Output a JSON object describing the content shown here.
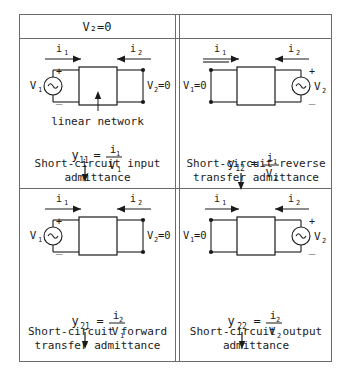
{
  "header": {
    "condition_label": "V₂=0"
  },
  "labels": {
    "i1": "i",
    "i1_sub": "1",
    "i2": "i",
    "i2_sub": "2",
    "v1": "V",
    "v1_sub": "1",
    "v2": "V",
    "v2_sub": "2",
    "v1_shorted": "V₁=0",
    "v2_shorted": "V₂=0",
    "plus": "+",
    "minus": "−",
    "network_note": "linear network",
    "source_symbol": "~"
  },
  "quadrants": [
    {
      "id": "q1",
      "name": "short-circuit-input-admittance",
      "param": "y",
      "param_sub": "11",
      "equals": "=",
      "numerator": "i",
      "numerator_sub": "1",
      "denominator": "V",
      "denominator_sub": "1",
      "left_source": true,
      "right_source": false,
      "left_label": "V",
      "left_label_sub": "1",
      "right_label": "V₂=0",
      "network_note": "linear network",
      "caption": "Short-circuit input\nadmittance"
    },
    {
      "id": "q2",
      "name": "short-circuit-reverse-transfer-admittance",
      "param": "y",
      "param_sub": "12",
      "equals": "=",
      "numerator": "i",
      "numerator_sub": "1",
      "denominator": "V",
      "denominator_sub": "2",
      "left_source": false,
      "right_source": true,
      "left_label": "V₁=0",
      "right_label": "V",
      "right_label_sub": "2",
      "network_note": "",
      "caption": "Short-circuit reverse\ntransfer admittance"
    },
    {
      "id": "q3",
      "name": "short-circuit-forward-transfer-admittance",
      "param": "y",
      "param_sub": "21",
      "equals": "=",
      "numerator": "i",
      "numerator_sub": "2",
      "denominator": "V",
      "denominator_sub": "1",
      "left_source": true,
      "right_source": false,
      "left_label": "V",
      "left_label_sub": "1",
      "right_label": "V₂=0",
      "network_note": "",
      "caption": "Short-circuit forward\ntransfer admittance"
    },
    {
      "id": "q4",
      "name": "short-circuit-output-admittance",
      "param": "y",
      "param_sub": "22",
      "equals": "=",
      "numerator": "i",
      "numerator_sub": "2",
      "denominator": "V",
      "denominator_sub": "2",
      "left_source": false,
      "right_source": true,
      "left_label": "V₁=0",
      "right_label": "V",
      "right_label_sub": "2",
      "network_note": "",
      "caption": "Short-circuit output\nadmittance"
    }
  ],
  "colors": {
    "ink": "#1a1a1a",
    "rule": "#6b6b6b",
    "background": "#ffffff"
  }
}
